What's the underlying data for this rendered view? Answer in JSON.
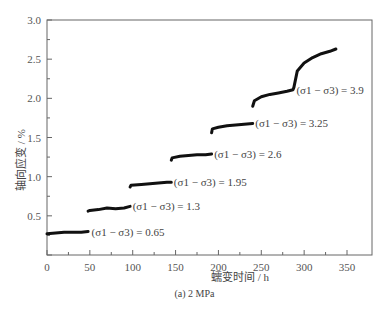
{
  "chart_data": {
    "type": "line",
    "title": "",
    "caption": "(a) 2 MPa",
    "xlabel": "蠕变时间 / h",
    "ylabel": "轴向应变 / %",
    "xlim": [
      0,
      350
    ],
    "ylim": [
      0,
      3.0
    ],
    "xticks": [
      "0",
      "50",
      "100",
      "150",
      "200",
      "250",
      "300",
      "350"
    ],
    "yticks": [
      "0.5",
      "1.0",
      "1.5",
      "2.0",
      "2.5",
      "3.0"
    ],
    "grid": false,
    "series": [
      {
        "name": "(σ1 − σ3) = 0.65",
        "x": [
          0,
          10,
          20,
          30,
          40,
          48
        ],
        "y": [
          0.27,
          0.28,
          0.29,
          0.29,
          0.29,
          0.3
        ]
      },
      {
        "name": "(σ1 − σ3) = 1.3",
        "x": [
          48,
          50,
          60,
          70,
          80,
          90,
          97
        ],
        "y": [
          0.56,
          0.57,
          0.58,
          0.6,
          0.59,
          0.6,
          0.62
        ]
      },
      {
        "name": "(σ1 − σ3) = 1.95",
        "x": [
          97,
          98,
          110,
          120,
          130,
          140,
          145
        ],
        "y": [
          0.87,
          0.89,
          0.9,
          0.91,
          0.92,
          0.93,
          0.93
        ]
      },
      {
        "name": "(σ1 − σ3) = 2.6",
        "x": [
          145,
          146,
          155,
          165,
          175,
          185,
          192
        ],
        "y": [
          1.21,
          1.24,
          1.26,
          1.27,
          1.28,
          1.28,
          1.29
        ]
      },
      {
        "name": "(σ1 − σ3) = 3.25",
        "x": [
          192,
          193,
          200,
          210,
          220,
          230,
          240
        ],
        "y": [
          1.56,
          1.61,
          1.63,
          1.65,
          1.66,
          1.67,
          1.68
        ]
      },
      {
        "name": "(σ1 − σ3) = 3.9",
        "x": [
          240,
          242,
          250,
          260,
          270,
          280,
          287,
          288,
          292,
          300,
          310,
          320,
          330,
          337
        ],
        "y": [
          1.9,
          1.97,
          2.02,
          2.05,
          2.07,
          2.09,
          2.11,
          2.14,
          2.35,
          2.45,
          2.52,
          2.57,
          2.6,
          2.63
        ]
      }
    ],
    "annotations": [
      {
        "text": "(σ1 − σ3) = 0.65",
        "x": 52,
        "y": 0.3
      },
      {
        "text": "(σ1 − σ3) = 1.3",
        "x": 100,
        "y": 0.62
      },
      {
        "text": "(σ1 − σ3) = 1.95",
        "x": 148,
        "y": 0.93
      },
      {
        "text": "(σ1 − σ3) = 2.6",
        "x": 195,
        "y": 1.29
      },
      {
        "text": "(σ1 − σ3) = 3.25",
        "x": 243,
        "y": 1.68
      },
      {
        "text": "(σ1 − σ3) = 3.9",
        "x": 291,
        "y": 2.11
      }
    ]
  }
}
